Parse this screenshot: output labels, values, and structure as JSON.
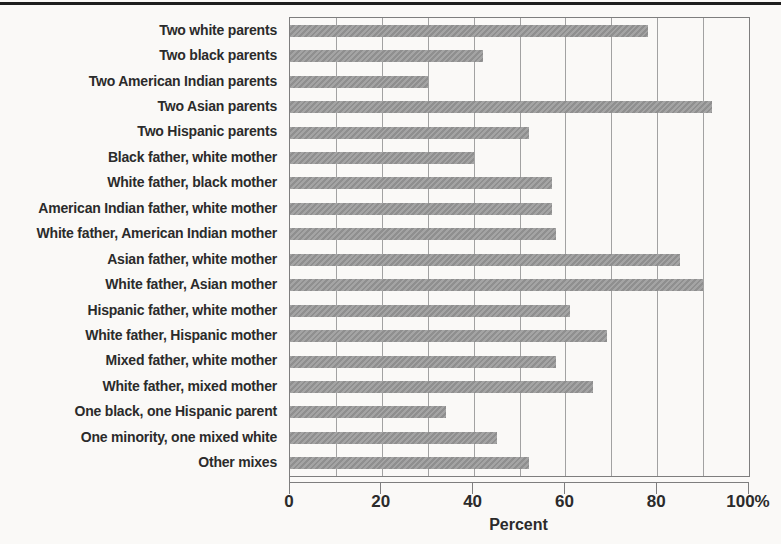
{
  "chart_data": {
    "type": "bar",
    "orientation": "horizontal",
    "title": "",
    "xlabel": "Percent",
    "xlim": [
      0,
      100
    ],
    "x_ticks": [
      0,
      20,
      40,
      60,
      80,
      100
    ],
    "x_tick_labels": [
      "0",
      "20",
      "40",
      "60",
      "80",
      "100%"
    ],
    "grid_on": true,
    "grid_interval": 10,
    "legend": "none",
    "bar_color": "#999999",
    "grid_color": "#a2a2a2",
    "frame_color": "#7e7e7e",
    "text_color": "#2b2b2b",
    "categories": [
      "Two white parents",
      "Two black parents",
      "Two American Indian parents",
      "Two Asian parents",
      "Two Hispanic parents",
      "Black father, white mother",
      "White father, black mother",
      "American Indian father, white mother",
      "White father, American Indian mother",
      "Asian father, white mother",
      "White father, Asian mother",
      "Hispanic father, white mother",
      "White father, Hispanic mother",
      "Mixed father, white mother",
      "White father, mixed mother",
      "One black, one Hispanic parent",
      "One minority, one mixed white",
      "Other mixes"
    ],
    "values": [
      78,
      42,
      30,
      92,
      52,
      40,
      57,
      57,
      58,
      85,
      90,
      61,
      69,
      58,
      66,
      34,
      45,
      52
    ]
  }
}
